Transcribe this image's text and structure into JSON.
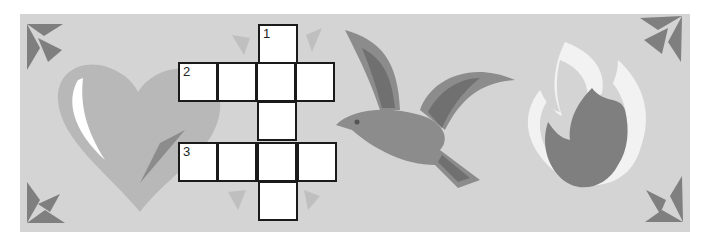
{
  "puzzle": {
    "type": "crossword",
    "clue_numbers": {
      "down1": "1",
      "across2": "2",
      "across3": "3"
    },
    "cells": [
      {
        "id": "r0c2",
        "row": 0,
        "col": 2,
        "number": "1"
      },
      {
        "id": "r1c0",
        "row": 1,
        "col": 0,
        "number": "2"
      },
      {
        "id": "r1c1",
        "row": 1,
        "col": 1
      },
      {
        "id": "r1c2",
        "row": 1,
        "col": 2
      },
      {
        "id": "r1c3",
        "row": 1,
        "col": 3
      },
      {
        "id": "r2c2",
        "row": 2,
        "col": 2
      },
      {
        "id": "r3c0",
        "row": 3,
        "col": 0,
        "number": "3"
      },
      {
        "id": "r3c1",
        "row": 3,
        "col": 1
      },
      {
        "id": "r3c2",
        "row": 3,
        "col": 2
      },
      {
        "id": "r3c3",
        "row": 3,
        "col": 3
      },
      {
        "id": "r4c2",
        "row": 4,
        "col": 2
      }
    ]
  },
  "illustrations": {
    "left": "heart-icon",
    "middle": "dove-icon",
    "right": "flame-icon",
    "corners": "arrow-icon"
  },
  "colors": {
    "background": "#d4d4d4",
    "heart": "#b8b8b8",
    "heart_highlight": "#ffffff",
    "dark_gray": "#7f7f7f",
    "medium_gray": "#9a9a9a",
    "flame_outline": "#f2f2f2",
    "cell_fill": "#ffffff",
    "cell_border": "#1a1a1a"
  }
}
